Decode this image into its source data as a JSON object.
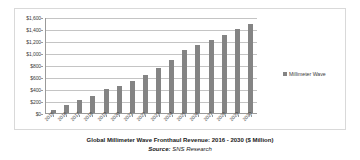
{
  "chart_data": {
    "type": "bar",
    "title": "Global Millimeter Wave Fronthaul Revenue: 2016 - 2030 ($ Million)",
    "source": "SNS Research",
    "source_label": "Source:",
    "xlabel": "",
    "ylabel": "",
    "ylim": [
      0,
      1600
    ],
    "ytick_step": 200,
    "grid": true,
    "legend_position": "right",
    "bar_color": "#848484",
    "categories": [
      "2015",
      "2016",
      "2017",
      "2018",
      "2019",
      "2020",
      "2021",
      "2022",
      "2023",
      "2024",
      "2025",
      "2026",
      "2027",
      "2028",
      "2029",
      "2030"
    ],
    "ytick_labels": [
      "$0",
      "$200",
      "$400",
      "$600",
      "$800",
      "$1,000",
      "$1,200",
      "$1,400",
      "$1,600"
    ],
    "ytick_values": [
      0,
      200,
      400,
      600,
      800,
      1000,
      1200,
      1400,
      1600
    ],
    "series": [
      {
        "name": "Millimeter Wave",
        "color": "#848484",
        "values": [
          50,
          135,
          215,
          290,
          395,
          455,
          535,
          630,
          755,
          890,
          1050,
          1130,
          1210,
          1295,
          1400,
          1480
        ]
      }
    ]
  },
  "legend": {
    "items": [
      {
        "label": "Millimeter Wave",
        "marker": "square-marker"
      }
    ]
  }
}
